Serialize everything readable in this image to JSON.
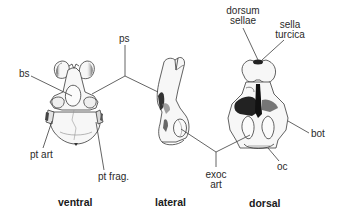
{
  "figure": {
    "views": [
      {
        "id": "ventral",
        "label": "ventral"
      },
      {
        "id": "lateral",
        "label": "lateral"
      },
      {
        "id": "dorsal",
        "label": "dorsal"
      }
    ],
    "annotations": {
      "ps": "ps",
      "bs": "bs",
      "dorsum_sellae_line1": "dorsum",
      "dorsum_sellae_line2": "sellae",
      "sella_turcica_line1": "sella",
      "sella_turcica_line2": "turcica",
      "pt_art": "pt art",
      "pt_frag": "pt frag.",
      "bot": "bot",
      "oc": "oc",
      "exoc_art_line1": "exoc",
      "exoc_art_line2": "art"
    },
    "colors": {
      "background": "#ffffff",
      "line": "#444444",
      "bone_fill": "#f4f4f4",
      "shade_dark": "#1e1e1e",
      "shade_mid": "#8a8a8a"
    }
  }
}
